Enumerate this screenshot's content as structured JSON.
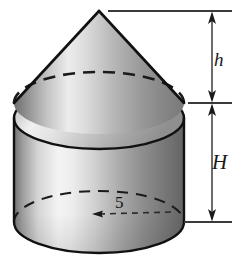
{
  "figure": {
    "background_color": "#ffffff",
    "outline_color": "#1a1a1a",
    "labels": {
      "cone_height": "h",
      "cylinder_height": "H",
      "radius": "5"
    },
    "dimension_axis": {
      "top_tick_label": "",
      "middle_tick_label": "",
      "bottom_tick_label": "",
      "arrow_style": "double-headed"
    },
    "geometry": {
      "center_x": 99,
      "cylinder_left_x": 14,
      "cylinder_right_x": 184,
      "cone_apex_y": 11,
      "cone_base_center_y": 103,
      "cylinder_top_center_y": 118,
      "cylinder_bottom_center_y": 222,
      "ellipse_rx": 85,
      "ellipse_ry": 31,
      "radius_value": 5
    },
    "shading": {
      "cone_light": "#f2f2f2",
      "cone_mid": "#b4b4b4",
      "cone_dark": "#6e6e6e",
      "cylinder_light": "#fafafa",
      "cylinder_mid": "#c0c0c0",
      "cylinder_dark": "#5e5e5e",
      "cap_light": "#fdfdfd",
      "cap_dark": "#9a9a9a"
    }
  }
}
